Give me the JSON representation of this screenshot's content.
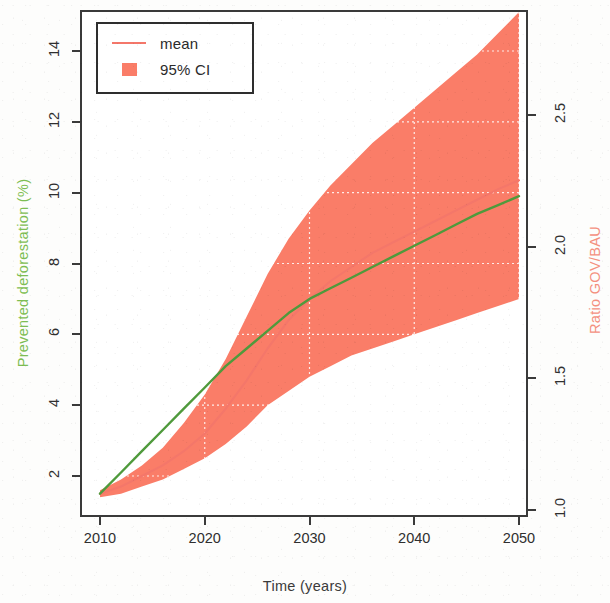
{
  "chart_data": {
    "type": "area",
    "title": "",
    "xlabel": "Time (years)",
    "ylabel_left": "Prevented deforestation (%)",
    "ylabel_right": "Ratio GOV/BAU",
    "xlim": [
      2008,
      2052
    ],
    "ylim_left": [
      1.0,
      15.2
    ],
    "ylim_right": [
      0.98,
      2.7
    ],
    "grid": true,
    "grid_style": "white dotted",
    "legend_position": "top-left",
    "legend": [
      {
        "label": "mean",
        "marker": "line",
        "color": "#f4776a"
      },
      {
        "label": "95% CI",
        "marker": "square",
        "color": "#fa7d68"
      }
    ],
    "x_ticks": [
      2010,
      2020,
      2030,
      2040,
      2050
    ],
    "x_tick_labels": [
      "2010",
      "2020",
      "2030",
      "2040",
      "2050"
    ],
    "y_ticks_left": [
      2,
      4,
      6,
      8,
      10,
      12,
      14
    ],
    "y_tick_labels_left": [
      "2",
      "4",
      "6",
      "8",
      "10",
      "12",
      "14"
    ],
    "y_ticks_right": [
      1.0,
      1.5,
      2.0,
      2.5
    ],
    "y_tick_labels_right": [
      "1.0",
      "1.5",
      "2.0",
      "2.5"
    ],
    "x": [
      2010,
      2012,
      2014,
      2016,
      2018,
      2020,
      2022,
      2024,
      2026,
      2028,
      2030,
      2032,
      2034,
      2036,
      2038,
      2040,
      2042,
      2044,
      2046,
      2048,
      2050
    ],
    "series": [
      {
        "name": "mean",
        "axis": "right",
        "color": "#f4776a",
        "values": [
          1.5,
          1.7,
          2.0,
          2.3,
          2.7,
          3.2,
          3.9,
          4.7,
          5.6,
          6.4,
          7.0,
          7.5,
          7.9,
          8.3,
          8.6,
          8.9,
          9.2,
          9.5,
          9.8,
          10.1,
          10.35
        ]
      },
      {
        "name": "Prevented deforestation",
        "axis": "left",
        "color": "#4f9a3c",
        "values": [
          1.5,
          2.1,
          2.7,
          3.3,
          3.9,
          4.5,
          5.1,
          5.6,
          6.1,
          6.6,
          7.0,
          7.3,
          7.6,
          7.9,
          8.2,
          8.5,
          8.8,
          9.1,
          9.4,
          9.65,
          9.9
        ]
      }
    ],
    "confidence_band": {
      "name": "95% CI",
      "color": "#fa7d68",
      "upper": [
        1.6,
        1.9,
        2.3,
        2.8,
        3.5,
        4.3,
        5.3,
        6.5,
        7.7,
        8.7,
        9.5,
        10.2,
        10.8,
        11.4,
        11.9,
        12.4,
        12.9,
        13.4,
        13.9,
        14.5,
        15.1
      ],
      "lower": [
        1.4,
        1.5,
        1.7,
        1.9,
        2.2,
        2.5,
        2.9,
        3.4,
        4.0,
        4.4,
        4.8,
        5.1,
        5.4,
        5.6,
        5.8,
        6.0,
        6.2,
        6.4,
        6.6,
        6.8,
        7.0
      ]
    }
  },
  "legend": {
    "mean_label": "mean",
    "ci_label": "95% CI"
  },
  "axes": {
    "x_title": "Time (years)",
    "y_left_title": "Prevented deforestation (%)",
    "y_right_title": "Ratio GOV/BAU"
  }
}
